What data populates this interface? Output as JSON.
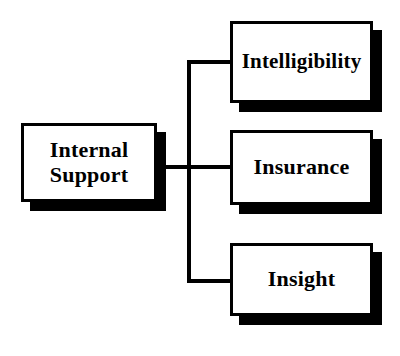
{
  "diagram": {
    "type": "org-chart",
    "orientation": "left-to-right",
    "background_color": "#ffffff",
    "line_color": "#000000",
    "box_fill_color": "#ffffff",
    "box_border_color": "#000000",
    "shadow_color": "#000000",
    "root": {
      "id": "internal-support",
      "label": "Internal\nSupport",
      "x": 21,
      "y": 123,
      "width": 136,
      "height": 79
    },
    "children": [
      {
        "id": "intelligibility",
        "label": "Intelligibility",
        "x": 230,
        "y": 21,
        "width": 143,
        "height": 82
      },
      {
        "id": "insurance",
        "label": "Insurance",
        "x": 230,
        "y": 130,
        "width": 143,
        "height": 75
      },
      {
        "id": "insight",
        "label": "Insight",
        "x": 230,
        "y": 243,
        "width": 143,
        "height": 73
      }
    ],
    "connectors": {
      "trunk_y": 167,
      "spine_x": 189,
      "spine_top_y": 62,
      "spine_bottom_y": 281,
      "branch_stub_ys": [
        62,
        167,
        281
      ]
    }
  }
}
